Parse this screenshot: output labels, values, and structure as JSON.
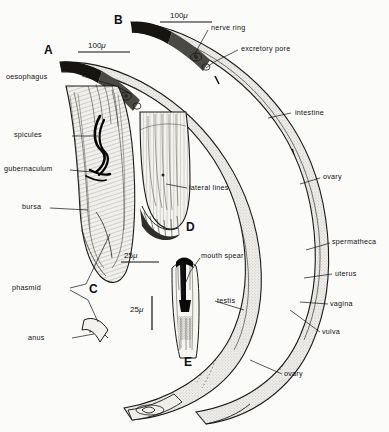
{
  "figure": {
    "background_color": "#fbfbfa",
    "ink_color": "#111111",
    "fill_color": "#e8e7e3"
  },
  "panels": [
    {
      "id": "A",
      "label": "A",
      "x": 44,
      "y": 44,
      "caption": "male whole body"
    },
    {
      "id": "B",
      "label": "B",
      "x": 114,
      "y": 14,
      "caption": "female whole body"
    },
    {
      "id": "C",
      "label": "C",
      "x": 89,
      "y": 283,
      "caption": "male tail"
    },
    {
      "id": "D",
      "label": "D",
      "x": 186,
      "y": 221,
      "caption": "female tail"
    },
    {
      "id": "E",
      "label": "E",
      "x": 184,
      "y": 356,
      "caption": "head with spear"
    }
  ],
  "scale_bars": [
    {
      "id": "scale-a",
      "text": "100",
      "unit": "μ",
      "x": 78,
      "y": 42,
      "length": 52,
      "orientation": "horizontal"
    },
    {
      "id": "scale-b",
      "text": "100",
      "unit": "μ",
      "x": 160,
      "y": 12,
      "length": 52,
      "orientation": "horizontal"
    },
    {
      "id": "scale-c",
      "text": "25",
      "unit": "μ",
      "x": 121,
      "y": 252,
      "length": 38,
      "orientation": "horizontal"
    },
    {
      "id": "scale-e",
      "text": "25",
      "unit": "μ",
      "x": 134,
      "y": 298,
      "length": 34,
      "orientation": "vertical"
    }
  ],
  "labels": [
    {
      "id": "oesophagus",
      "text": "oesophagus",
      "x": 44,
      "y": 76,
      "anchor": "right"
    },
    {
      "id": "spicules",
      "text": "spicules",
      "x": 41,
      "y": 134,
      "anchor": "right"
    },
    {
      "id": "gubernaculum",
      "text": "gubernaculum",
      "x": 16,
      "y": 168,
      "anchor": "right"
    },
    {
      "id": "bursa",
      "text": "bursa",
      "x": 27,
      "y": 206,
      "anchor": "right"
    },
    {
      "id": "phasmid",
      "text": "phasmid",
      "x": 40,
      "y": 287,
      "anchor": "right"
    },
    {
      "id": "anus",
      "text": "anus",
      "x": 48,
      "y": 337,
      "anchor": "right"
    },
    {
      "id": "nerve-ring",
      "text": "nerve ring",
      "x": 211,
      "y": 27,
      "anchor": "left"
    },
    {
      "id": "excretory-pore",
      "text": "excretory pore",
      "x": 240,
      "y": 48,
      "anchor": "left"
    },
    {
      "id": "intestine",
      "text": "intestine",
      "x": 294,
      "y": 112,
      "anchor": "left"
    },
    {
      "id": "ovary-upper",
      "text": "ovary",
      "x": 322,
      "y": 176,
      "anchor": "left"
    },
    {
      "id": "spermatheca",
      "text": "spermatheca",
      "x": 332,
      "y": 240,
      "anchor": "left"
    },
    {
      "id": "uterus",
      "text": "uterus",
      "x": 334,
      "y": 272,
      "anchor": "left"
    },
    {
      "id": "vagina",
      "text": "vagina",
      "x": 330,
      "y": 302,
      "anchor": "left"
    },
    {
      "id": "vulva",
      "text": "vulva",
      "x": 322,
      "y": 330,
      "anchor": "left"
    },
    {
      "id": "ovary-lower",
      "text": "ovary",
      "x": 284,
      "y": 372,
      "anchor": "left"
    },
    {
      "id": "lateral-lines",
      "text": "lateral lines",
      "x": 189,
      "y": 186,
      "anchor": "left"
    },
    {
      "id": "mouth-spear",
      "text": "mouth spear",
      "x": 202,
      "y": 255,
      "anchor": "left"
    },
    {
      "id": "testis",
      "text": "testis",
      "x": 217,
      "y": 299,
      "anchor": "left"
    }
  ]
}
